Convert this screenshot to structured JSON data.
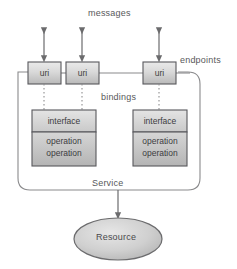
{
  "diagram": {
    "labels": {
      "messages": "messages",
      "endpoints": "endpoints",
      "bindings": "bindings",
      "service": "Service",
      "resource": "Resource"
    },
    "endpoints": [
      {
        "label": "uri",
        "x": 28,
        "y": 62,
        "w": 33,
        "h": 22
      },
      {
        "label": "uri",
        "x": 66,
        "y": 62,
        "w": 33,
        "h": 22
      },
      {
        "label": "uri",
        "x": 143,
        "y": 62,
        "w": 33,
        "h": 22
      }
    ],
    "interfaces": [
      {
        "header": "interface",
        "operations": [
          "operation",
          "operation"
        ],
        "x": 32,
        "y": 110,
        "w": 64,
        "h": 56
      },
      {
        "header": "interface",
        "operations": [
          "operation",
          "operation"
        ],
        "x": 133,
        "y": 110,
        "w": 54,
        "h": 56
      }
    ],
    "service_box": {
      "x": 18,
      "y": 72,
      "w": 182,
      "h": 118,
      "radius": 12
    },
    "resource_ellipse": {
      "cx": 118,
      "cy": 239,
      "rx": 44,
      "ry": 21
    },
    "message_arrows": [
      {
        "x": 44,
        "top": 28,
        "bottom": 62
      },
      {
        "x": 82,
        "top": 28,
        "bottom": 62
      },
      {
        "x": 159,
        "top": 28,
        "bottom": 62
      }
    ],
    "binding_connectors": [
      {
        "x": 44,
        "top": 84,
        "bottom": 110
      },
      {
        "x": 82,
        "top": 84,
        "bottom": 110
      },
      {
        "x": 159,
        "top": 84,
        "bottom": 110
      }
    ],
    "service_resource_arrow": {
      "x": 118,
      "top": 190,
      "bottom": 218
    },
    "colors": {
      "stroke": "#6e6e70",
      "box_stroke": "#55555a",
      "fill_light": "#e8e8e8",
      "fill_mid": "#d2d2d2",
      "fill_dark": "#bdbdbd",
      "text": "#3f3f41",
      "label_text": "#58585a",
      "background": "#ffffff"
    }
  }
}
